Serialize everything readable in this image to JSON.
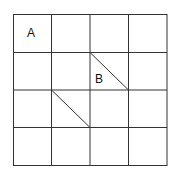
{
  "grid": {
    "rows": 4,
    "cols": 4,
    "x0": 13,
    "y0": 14,
    "x1": 167,
    "y1": 165,
    "line_color": "#333333"
  },
  "labels": [
    {
      "text": "A",
      "x": 27,
      "y": 28
    },
    {
      "text": "B",
      "x": 94,
      "y": 73
    }
  ],
  "diagonals": [
    {
      "x1": 90,
      "y1": 52,
      "x2": 128,
      "y2": 90
    },
    {
      "x1": 51,
      "y1": 90,
      "x2": 90,
      "y2": 127
    }
  ]
}
